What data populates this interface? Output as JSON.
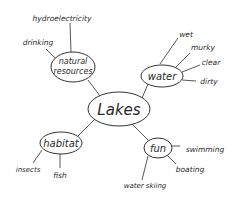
{
  "diagram": {
    "type": "mind-map",
    "center": {
      "label": "Lakes"
    },
    "branches": [
      {
        "label": "natural resources",
        "label_lines": [
          "natural",
          "resources"
        ],
        "leaves": [
          "hydroelectricity",
          "drinking"
        ]
      },
      {
        "label": "water",
        "leaves": [
          "wet",
          "murky",
          "clear",
          "dirty"
        ]
      },
      {
        "label": "habitat",
        "leaves": [
          "insects",
          "fish"
        ]
      },
      {
        "label": "fun",
        "leaves": [
          "swimming",
          "boating",
          "water skiing"
        ]
      }
    ]
  }
}
